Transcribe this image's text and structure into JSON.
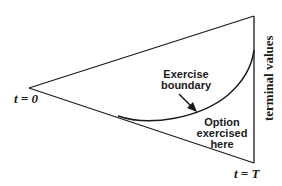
{
  "diagram": {
    "type": "binomial-tree-exercise-region",
    "labels": {
      "start_time": "t = 0",
      "end_time": "t = T",
      "terminal": "terminal values",
      "boundary_line1": "Exercise",
      "boundary_line2": "boundary",
      "region_line1": "Option",
      "region_line2": "exercised",
      "region_line3": "here"
    },
    "colors": {
      "stroke": "#1a1a1a",
      "background": "#ffffff"
    }
  }
}
